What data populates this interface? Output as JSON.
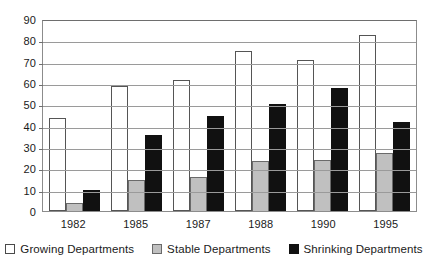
{
  "chart_data": {
    "type": "bar",
    "title": "",
    "xlabel": "",
    "ylabel": "",
    "ylim": [
      0,
      90
    ],
    "ytick_step": 10,
    "yticks": [
      90,
      80,
      70,
      60,
      50,
      40,
      30,
      20,
      10,
      0
    ],
    "grid": true,
    "legend_position": "bottom",
    "categories": [
      "1982",
      "1985",
      "1987",
      "1988",
      "1990",
      "1995"
    ],
    "series": [
      {
        "name": "Growing Departments",
        "color": "#ffffff",
        "values": [
          44,
          59,
          62,
          76,
          71.5,
          83.5
        ]
      },
      {
        "name": "Stable Departments",
        "color": "#c0c0c0",
        "values": [
          4,
          14.5,
          16,
          23.5,
          24,
          27.5
        ]
      },
      {
        "name": "Shrinking Departments",
        "color": "#111111",
        "values": [
          10,
          36,
          45,
          50.5,
          58.5,
          42
        ]
      }
    ]
  }
}
